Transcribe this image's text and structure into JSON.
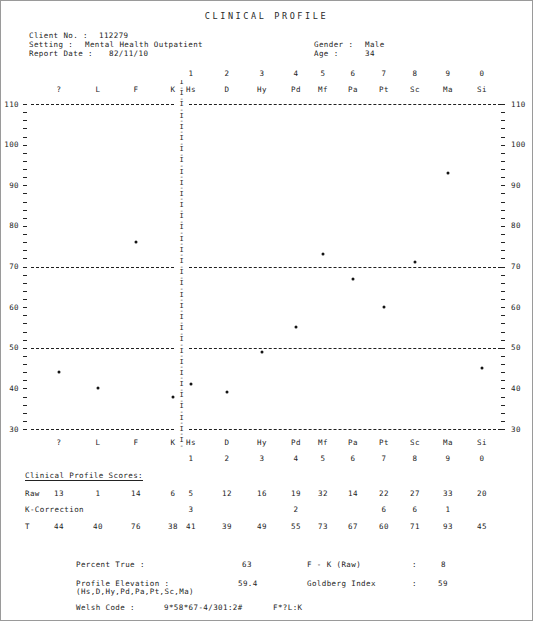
{
  "report": {
    "title": "CLINICAL PROFILE",
    "fields": {
      "client_no_label": "Client No. :",
      "client_no_value": "112279",
      "setting_label": "Setting :",
      "setting_value": "Mental Health Outpatient",
      "report_date_label": "Report Date :",
      "report_date_value": "82/11/10",
      "gender_label": "Gender :",
      "gender_value": "Male",
      "age_label": "Age :",
      "age_value": "34"
    }
  },
  "chart_data": {
    "type": "line",
    "title": "CLINICAL PROFILE",
    "xlabel": "",
    "ylabel": "T",
    "ylim": [
      30,
      110
    ],
    "yticks": [
      30,
      40,
      50,
      60,
      70,
      80,
      90,
      100,
      110
    ],
    "grid": "dashed reference lines at T = 30, 50, 70, 110",
    "reference_lines": [
      30,
      50,
      70,
      110
    ],
    "legend": "none",
    "groups": [
      {
        "name": "validity",
        "categories": [
          "?",
          "L",
          "F",
          "K"
        ]
      },
      {
        "name": "clinical",
        "categories": [
          "Hs",
          "D",
          "Hy",
          "Pd",
          "Mf",
          "Pa",
          "Pt",
          "Sc",
          "Ma",
          "Si"
        ]
      }
    ],
    "categories": [
      "?",
      "L",
      "F",
      "K",
      "Hs",
      "D",
      "Hy",
      "Pd",
      "Mf",
      "Pa",
      "Pt",
      "Sc",
      "Ma",
      "Si"
    ],
    "scale_numbers": [
      "",
      "",
      "",
      "",
      "1",
      "2",
      "3",
      "4",
      "5",
      "6",
      "7",
      "8",
      "9",
      "0"
    ],
    "values": [
      44,
      40,
      76,
      38,
      41,
      39,
      49,
      55,
      73,
      67,
      60,
      71,
      93,
      45
    ],
    "series": [
      {
        "name": "T-score",
        "values": [
          44,
          40,
          76,
          38,
          41,
          39,
          49,
          55,
          73,
          67,
          60,
          71,
          93,
          45
        ]
      }
    ]
  },
  "scores": {
    "section_title": "Clinical Profile Scores:",
    "row_labels": {
      "raw": "Raw",
      "k_correction": "K-Correction",
      "t": "T"
    },
    "raw": [
      "13",
      "1",
      "14",
      "6",
      "5",
      "12",
      "16",
      "19",
      "32",
      "14",
      "22",
      "27",
      "33",
      "20"
    ],
    "k_correction": [
      "",
      "",
      "",
      "",
      "3",
      "",
      "",
      "2",
      "",
      "",
      "6",
      "6",
      "1",
      ""
    ],
    "t": [
      "44",
      "40",
      "76",
      "38",
      "41",
      "39",
      "49",
      "55",
      "73",
      "67",
      "60",
      "71",
      "93",
      "45"
    ]
  },
  "summary": {
    "percent_true_label": "Percent True :",
    "percent_true_value": "63",
    "profile_elevation_label": "Profile Elevation :",
    "profile_elevation_value": "59.4",
    "profile_elevation_note": "(Hs,D,Hy,Pd,Pa,Pt,Sc,Ma)",
    "fk_raw_label": "F - K (Raw)",
    "fk_raw_sep": ":",
    "fk_raw_value": "8",
    "goldberg_label": "Goldberg Index",
    "goldberg_sep": ":",
    "goldberg_value": "59",
    "welsh_label": "Welsh Code :",
    "welsh_value": "9*58*67-4/301:2#",
    "welsh_validity": "F*?L:K"
  },
  "colors": {
    "ink": "#232323",
    "marker": "#141414",
    "frame": "#9a9a9a"
  }
}
